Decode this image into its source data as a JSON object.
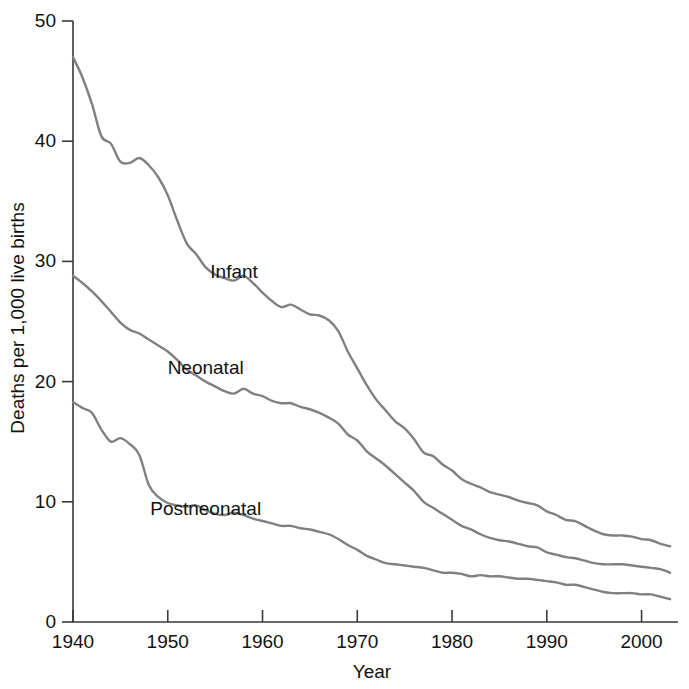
{
  "chart_data": {
    "type": "line",
    "title": "",
    "xlabel": "Year",
    "ylabel": "Deaths per 1,000 live births",
    "xlim": [
      1940,
      2003
    ],
    "ylim": [
      0,
      50
    ],
    "grid": false,
    "legend_position": "inline-labels",
    "x_ticks": [
      "1940",
      "1950",
      "1960",
      "1970",
      "1980",
      "1990",
      "2000"
    ],
    "x_tick_values": [
      1940,
      1950,
      1960,
      1970,
      1980,
      1990,
      2000
    ],
    "y_ticks": [
      "0",
      "10",
      "20",
      "30",
      "40",
      "50"
    ],
    "y_tick_values": [
      0,
      10,
      20,
      30,
      40,
      50
    ],
    "x": [
      1940,
      1941,
      1942,
      1943,
      1944,
      1945,
      1946,
      1947,
      1948,
      1949,
      1950,
      1951,
      1952,
      1953,
      1954,
      1955,
      1956,
      1957,
      1958,
      1959,
      1960,
      1961,
      1962,
      1963,
      1964,
      1965,
      1966,
      1967,
      1968,
      1969,
      1970,
      1971,
      1972,
      1973,
      1974,
      1975,
      1976,
      1977,
      1978,
      1979,
      1980,
      1981,
      1982,
      1983,
      1984,
      1985,
      1986,
      1987,
      1988,
      1989,
      1990,
      1991,
      1992,
      1993,
      1994,
      1995,
      1996,
      1997,
      1998,
      1999,
      2000,
      2001,
      2002,
      2003
    ],
    "series": [
      {
        "name": "Infant",
        "color": "#808080",
        "label_x": 1957,
        "label_y": 28.6,
        "values": [
          47.0,
          45.3,
          43.1,
          40.4,
          39.8,
          38.3,
          38.2,
          38.6,
          38.0,
          37.0,
          35.5,
          33.4,
          31.5,
          30.6,
          29.5,
          28.9,
          28.6,
          28.4,
          28.8,
          28.2,
          27.4,
          26.7,
          26.2,
          26.4,
          26.0,
          25.6,
          25.5,
          25.1,
          24.2,
          22.5,
          21.1,
          19.7,
          18.5,
          17.6,
          16.7,
          16.1,
          15.2,
          14.1,
          13.8,
          13.1,
          12.6,
          11.9,
          11.5,
          11.2,
          10.8,
          10.6,
          10.4,
          10.1,
          9.9,
          9.7,
          9.2,
          8.9,
          8.5,
          8.4,
          8.0,
          7.6,
          7.3,
          7.2,
          7.2,
          7.1,
          6.9,
          6.8,
          6.5,
          6.3
        ]
      },
      {
        "name": "Neonatal",
        "color": "#808080",
        "label_x": 1954,
        "label_y": 20.6,
        "values": [
          28.8,
          28.2,
          27.5,
          26.7,
          25.8,
          24.9,
          24.3,
          24.0,
          23.5,
          23.0,
          22.5,
          21.8,
          21.0,
          20.5,
          20.0,
          19.6,
          19.2,
          19.0,
          19.4,
          19.0,
          18.8,
          18.4,
          18.2,
          18.2,
          17.9,
          17.7,
          17.4,
          17.0,
          16.5,
          15.6,
          15.1,
          14.2,
          13.6,
          13.0,
          12.3,
          11.6,
          10.9,
          10.0,
          9.5,
          9.0,
          8.5,
          8.0,
          7.7,
          7.3,
          7.0,
          6.8,
          6.7,
          6.5,
          6.3,
          6.2,
          5.8,
          5.6,
          5.4,
          5.3,
          5.1,
          4.9,
          4.8,
          4.8,
          4.8,
          4.7,
          4.6,
          4.5,
          4.4,
          4.1
        ]
      },
      {
        "name": "Postneonatal",
        "color": "#808080",
        "label_x": 1954,
        "label_y": 8.9,
        "values": [
          18.3,
          17.8,
          17.4,
          16.0,
          15.0,
          15.3,
          14.8,
          13.9,
          11.4,
          10.4,
          9.9,
          9.7,
          9.6,
          9.7,
          9.3,
          9.0,
          8.9,
          9.1,
          8.9,
          8.6,
          8.4,
          8.2,
          8.0,
          8.0,
          7.8,
          7.7,
          7.5,
          7.3,
          6.9,
          6.4,
          6.0,
          5.5,
          5.2,
          4.9,
          4.8,
          4.7,
          4.6,
          4.5,
          4.3,
          4.1,
          4.1,
          4.0,
          3.8,
          3.9,
          3.8,
          3.8,
          3.7,
          3.6,
          3.6,
          3.5,
          3.4,
          3.3,
          3.1,
          3.1,
          2.9,
          2.7,
          2.5,
          2.4,
          2.4,
          2.4,
          2.3,
          2.3,
          2.1,
          1.9
        ]
      }
    ]
  },
  "axes": {
    "x_label": "Year",
    "y_label": "Deaths per 1,000 live births"
  },
  "colors": {
    "line": "#808080",
    "axis": "#3a3a3a",
    "text": "#111111",
    "background": "#ffffff"
  }
}
